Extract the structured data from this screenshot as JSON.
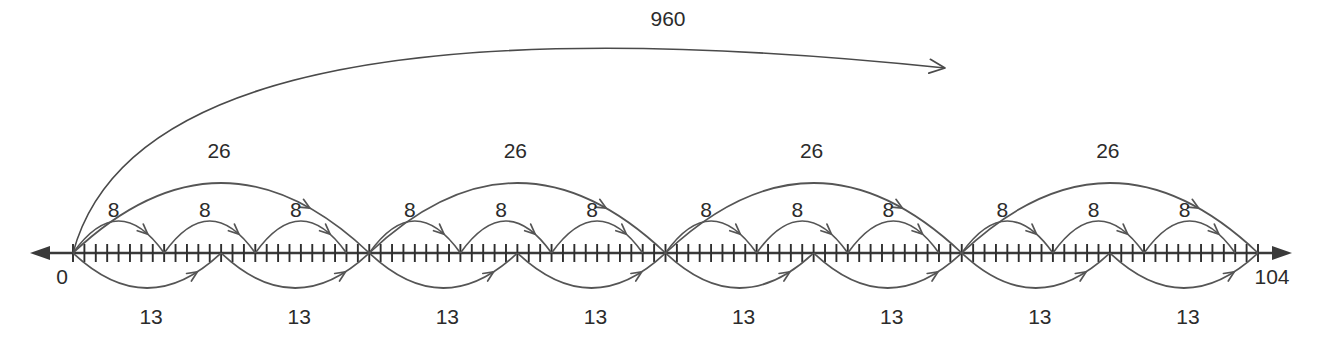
{
  "figure": {
    "type": "number-line-diagram",
    "title": "",
    "axis_start_label": "0",
    "axis_end_label": "104",
    "axis_min": 0,
    "axis_max": 104,
    "tick_step": 1,
    "left_arrow": true,
    "right_arrow": true,
    "colors": {
      "axis": "#3a3a3a",
      "arc": "#555555",
      "text": "#2b2b2b",
      "background": "#ffffff"
    }
  },
  "chart_data": {
    "type": "line",
    "title": "",
    "xlabel": "",
    "ylabel": "",
    "xlim": [
      0,
      104
    ],
    "grid": false,
    "legend": "none",
    "tick_labels": [
      "0",
      "104"
    ],
    "annotations": [
      {
        "label": "960",
        "from": 0,
        "to": 76,
        "position": "top",
        "span": "long-arc"
      },
      {
        "label": "26",
        "from": 0,
        "to": 26,
        "position": "above"
      },
      {
        "label": "26",
        "from": 26,
        "to": 52,
        "position": "above"
      },
      {
        "label": "26",
        "from": 52,
        "to": 78,
        "position": "above"
      },
      {
        "label": "26",
        "from": 78,
        "to": 104,
        "position": "above"
      },
      {
        "label": "8",
        "from": 0,
        "to": 8,
        "position": "above-inner"
      },
      {
        "label": "8",
        "from": 8,
        "to": 16,
        "position": "above-inner"
      },
      {
        "label": "8",
        "from": 16,
        "to": 24,
        "position": "above-inner"
      },
      {
        "label": "8",
        "from": 26,
        "to": 34,
        "position": "above-inner"
      },
      {
        "label": "8",
        "from": 34,
        "to": 42,
        "position": "above-inner"
      },
      {
        "label": "8",
        "from": 42,
        "to": 50,
        "position": "above-inner"
      },
      {
        "label": "8",
        "from": 52,
        "to": 60,
        "position": "above-inner"
      },
      {
        "label": "8",
        "from": 60,
        "to": 68,
        "position": "above-inner"
      },
      {
        "label": "8",
        "from": 68,
        "to": 76,
        "position": "above-inner"
      },
      {
        "label": "8",
        "from": 78,
        "to": 86,
        "position": "above-inner"
      },
      {
        "label": "8",
        "from": 86,
        "to": 94,
        "position": "above-inner"
      },
      {
        "label": "8",
        "from": 94,
        "to": 102,
        "position": "above-inner"
      },
      {
        "label": "13",
        "from": 0,
        "to": 13,
        "position": "below"
      },
      {
        "label": "13",
        "from": 13,
        "to": 26,
        "position": "below"
      },
      {
        "label": "13",
        "from": 26,
        "to": 39,
        "position": "below"
      },
      {
        "label": "13",
        "from": 39,
        "to": 52,
        "position": "below"
      },
      {
        "label": "13",
        "from": 52,
        "to": 65,
        "position": "below"
      },
      {
        "label": "13",
        "from": 65,
        "to": 78,
        "position": "below"
      },
      {
        "label": "13",
        "from": 78,
        "to": 91,
        "position": "below"
      },
      {
        "label": "13",
        "from": 91,
        "to": 104,
        "position": "below"
      }
    ]
  },
  "labels": {
    "big_arc": "960",
    "twentysix": [
      "26",
      "26",
      "26",
      "26"
    ],
    "eight": [
      "8",
      "8",
      "8",
      "8",
      "8",
      "8",
      "8",
      "8",
      "8",
      "8",
      "8",
      "8"
    ],
    "thirteen": [
      "13",
      "13",
      "13",
      "13",
      "13",
      "13",
      "13",
      "13"
    ],
    "zero": "0",
    "end": "104"
  }
}
